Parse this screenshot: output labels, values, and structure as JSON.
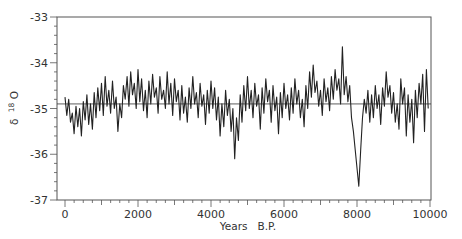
{
  "chart_data": {
    "type": "line",
    "title": "",
    "xlabel": "Years   B.P.",
    "ylabel": "δ 18O",
    "ylabel_parts": {
      "delta": "δ",
      "superscript": "18",
      "element": "O"
    },
    "xlim": [
      -200,
      10100
    ],
    "ylim": [
      -37,
      -33
    ],
    "xticks": [
      0,
      2000,
      4000,
      6000,
      8000,
      10000
    ],
    "xtick_labels": [
      "0",
      "2000",
      "4000",
      "6000",
      "8000",
      "10000"
    ],
    "yticks": [
      -33,
      -34,
      -35,
      -36,
      -37
    ],
    "ytick_labels": [
      "-33",
      "-34",
      "-35",
      "-36",
      "-37"
    ],
    "mean_line": -34.9,
    "grid": false,
    "legend": null,
    "series": [
      {
        "name": "δ18O",
        "color": "#222222",
        "x_start": 0,
        "x_step": 50,
        "values": [
          -34.75,
          -35.15,
          -34.8,
          -35.3,
          -35.1,
          -35.55,
          -34.95,
          -35.4,
          -35.0,
          -35.6,
          -34.85,
          -35.25,
          -34.7,
          -35.35,
          -34.9,
          -35.45,
          -34.65,
          -35.2,
          -34.55,
          -35.05,
          -34.45,
          -35.15,
          -34.3,
          -34.95,
          -34.6,
          -35.1,
          -34.4,
          -35.0,
          -34.75,
          -35.5,
          -34.9,
          -35.2,
          -34.5,
          -34.8,
          -34.3,
          -34.95,
          -34.2,
          -34.7,
          -34.45,
          -35.0,
          -34.15,
          -34.85,
          -34.35,
          -35.05,
          -34.6,
          -35.2,
          -34.4,
          -34.9,
          -34.25,
          -34.75,
          -34.55,
          -35.1,
          -34.3,
          -34.8,
          -34.6,
          -35.0,
          -34.2,
          -34.9,
          -34.45,
          -35.15,
          -34.35,
          -34.85,
          -34.6,
          -35.25,
          -34.5,
          -35.1,
          -34.75,
          -35.3,
          -34.55,
          -35.0,
          -34.3,
          -34.9,
          -34.65,
          -35.2,
          -34.45,
          -34.95,
          -34.7,
          -35.35,
          -34.6,
          -35.1,
          -34.4,
          -35.0,
          -34.55,
          -35.25,
          -34.75,
          -35.6,
          -34.9,
          -35.4,
          -34.6,
          -35.15,
          -34.8,
          -35.5,
          -35.0,
          -36.1,
          -35.2,
          -35.7,
          -34.7,
          -35.3,
          -34.5,
          -35.05,
          -34.3,
          -35.0,
          -34.6,
          -35.2,
          -34.45,
          -34.95,
          -34.7,
          -35.45,
          -34.55,
          -35.1,
          -34.35,
          -34.85,
          -34.6,
          -35.3,
          -34.5,
          -35.05,
          -34.75,
          -35.55,
          -34.65,
          -35.2,
          -34.45,
          -35.0,
          -34.7,
          -35.25,
          -34.55,
          -35.1,
          -34.35,
          -34.9,
          -34.6,
          -35.2,
          -34.8,
          -35.4,
          -34.5,
          -35.0,
          -34.2,
          -34.75,
          -34.05,
          -34.65,
          -34.4,
          -34.95,
          -34.6,
          -35.15,
          -34.35,
          -34.85,
          -34.55,
          -35.05,
          -34.3,
          -34.8,
          -34.15,
          -34.6,
          -34.35,
          -34.9,
          -33.65,
          -34.7,
          -34.3,
          -34.85,
          -34.5,
          -35.2,
          -35.5,
          -35.9,
          -36.3,
          -36.7,
          -35.9,
          -35.2,
          -34.8,
          -35.1,
          -34.6,
          -35.3,
          -34.7,
          -35.2,
          -34.5,
          -35.0,
          -34.7,
          -35.35,
          -34.55,
          -34.95,
          -34.2,
          -34.75,
          -34.5,
          -35.1,
          -34.65,
          -35.3,
          -34.9,
          -35.45,
          -34.35,
          -34.9,
          -34.55,
          -35.6,
          -34.7,
          -35.3,
          -34.8,
          -35.75,
          -34.6,
          -35.2,
          -34.45,
          -34.9,
          -34.25,
          -35.5,
          -34.15,
          -35.0
        ]
      }
    ]
  }
}
